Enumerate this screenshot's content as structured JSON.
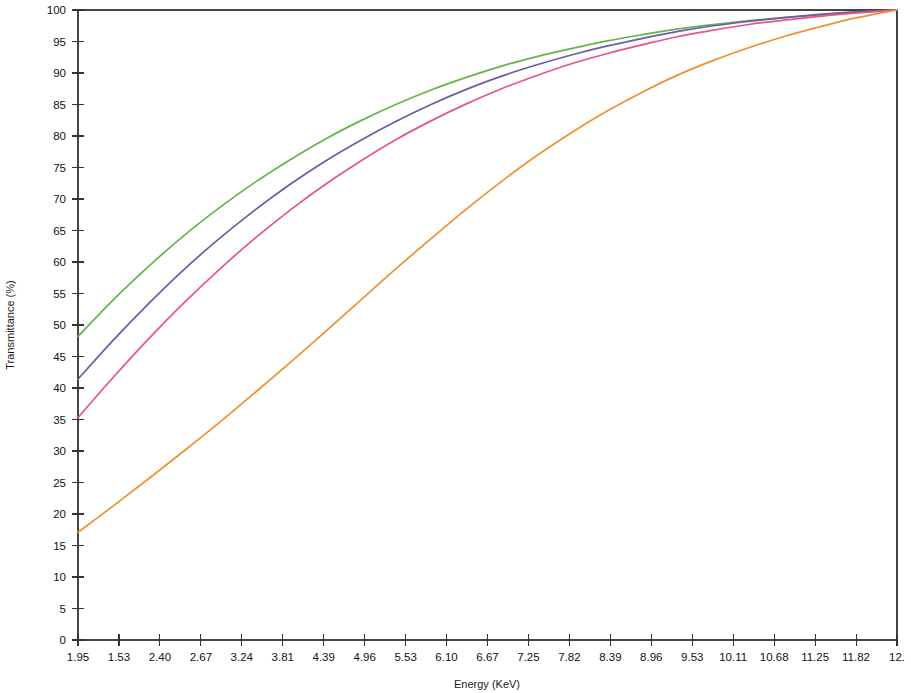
{
  "chart_data": {
    "type": "line",
    "title": "",
    "xlabel": "Energy (KeV)",
    "ylabel": "Transmittance (%)",
    "xlim": [
      1.95,
      12.39
    ],
    "ylim": [
      0,
      100
    ],
    "grid": false,
    "legend_position": "none",
    "x_tick_labels": [
      "1.95",
      "1.53",
      "2.40",
      "2.67",
      "3.24",
      "3.81",
      "4.39",
      "4.96",
      "5.53",
      "6.10",
      "6.67",
      "7.25",
      "7.82",
      "8.39",
      "8.96",
      "9.53",
      "10.11",
      "10.68",
      "11.25",
      "11.82",
      "12."
    ],
    "y_tick_labels": [
      "0",
      "5",
      "10",
      "15",
      "20",
      "25",
      "30",
      "35",
      "40",
      "45",
      "50",
      "55",
      "60",
      "65",
      "70",
      "75",
      "80",
      "85",
      "90",
      "95",
      "100"
    ],
    "y_ticks": [
      0,
      5,
      10,
      15,
      20,
      25,
      30,
      35,
      40,
      45,
      50,
      55,
      60,
      65,
      70,
      75,
      80,
      85,
      90,
      95,
      100
    ],
    "x": [
      1.95,
      2.4,
      2.85,
      3.3,
      3.75,
      4.2,
      4.65,
      5.1,
      5.55,
      6.0,
      6.45,
      6.9,
      7.35,
      7.8,
      8.25,
      8.7,
      9.15,
      9.6,
      10.05,
      10.5,
      10.95,
      11.4,
      11.85,
      12.39
    ],
    "series": [
      {
        "name": "curve-green",
        "color": "#63b44c",
        "values": [
          48.2,
          54.0,
          59.3,
          64.2,
          68.6,
          72.6,
          76.2,
          79.5,
          82.4,
          85.0,
          87.3,
          89.3,
          91.1,
          92.6,
          93.9,
          95.1,
          96.1,
          97.0,
          97.7,
          98.3,
          98.8,
          99.2,
          99.6,
          100.0
        ]
      },
      {
        "name": "curve-purple",
        "color": "#6b5ca5",
        "values": [
          41.4,
          47.6,
          53.4,
          58.8,
          63.7,
          68.2,
          72.3,
          76.0,
          79.3,
          82.3,
          85.0,
          87.4,
          89.5,
          91.3,
          92.9,
          94.3,
          95.5,
          96.6,
          97.5,
          98.2,
          98.8,
          99.3,
          99.7,
          100.0
        ]
      },
      {
        "name": "curve-pink",
        "color": "#e8538e",
        "values": [
          35.3,
          41.7,
          47.8,
          53.5,
          58.8,
          63.7,
          68.2,
          72.3,
          76.0,
          79.4,
          82.4,
          85.1,
          87.5,
          89.6,
          91.5,
          93.1,
          94.5,
          95.8,
          96.8,
          97.7,
          98.4,
          99.0,
          99.5,
          100.0
        ]
      },
      {
        "name": "curve-orange",
        "color": "#f09030",
        "values": [
          17.1,
          21.3,
          25.6,
          30.0,
          34.5,
          39.2,
          44.0,
          48.9,
          53.9,
          58.9,
          63.7,
          68.4,
          72.8,
          76.9,
          80.6,
          84.0,
          87.0,
          89.7,
          92.0,
          94.0,
          95.8,
          97.3,
          98.7,
          100.0
        ]
      }
    ]
  }
}
